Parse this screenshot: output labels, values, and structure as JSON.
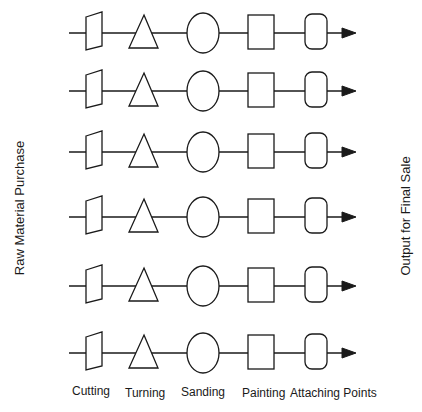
{
  "diagram": {
    "left_label": "Raw Material Purchase",
    "right_label": "Output for Final Sale",
    "stages": [
      {
        "name": "Cutting",
        "shape": "trapezoid",
        "x": 72,
        "y": 384
      },
      {
        "name": "Turning",
        "shape": "triangle",
        "x": 125,
        "y": 386
      },
      {
        "name": "Sanding",
        "shape": "ellipse",
        "x": 181,
        "y": 385
      },
      {
        "name": "Painting",
        "shape": "square",
        "x": 242,
        "y": 386
      },
      {
        "name": "Attaching Points",
        "shape": "rounded-rectangle",
        "x": 290,
        "y": 386
      }
    ],
    "rows": [
      33,
      91,
      152,
      217,
      286,
      353
    ],
    "line_color": "#1a1a1a"
  }
}
